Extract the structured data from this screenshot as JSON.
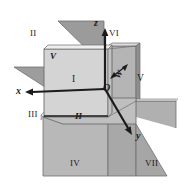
{
  "figure": {
    "background_color": "#ffffff",
    "stroke_color": "#1b1b1b"
  },
  "colors": {
    "plane_light": "#d0d0d0",
    "plane_mid": "#b9b9b9",
    "plane_dark": "#a3a3a3",
    "plane_darker": "#949494",
    "edge": "#6e6e6e",
    "axis": "#1b1b1b",
    "text": "#1b1b1b"
  },
  "axes": [
    {
      "name": "x-axis",
      "label": "x",
      "x": 16,
      "y": 93
    },
    {
      "name": "y-axis",
      "label": "y",
      "x": 136,
      "y": 137
    },
    {
      "name": "z-axis",
      "label": "z",
      "x": 96,
      "y": 24
    }
  ],
  "origin": {
    "name": "origin",
    "label": "O",
    "x": 106,
    "y": 89
  },
  "planes": [
    {
      "name": "v-plane",
      "label": "V",
      "x": 52,
      "y": 57
    },
    {
      "name": "h-plane",
      "label": "H",
      "x": 78,
      "y": 118
    },
    {
      "name": "w-plane",
      "label": "W",
      "x": 119,
      "y": 75
    }
  ],
  "octants": [
    {
      "name": "octant-1",
      "label": "I",
      "x": 75,
      "y": 79
    },
    {
      "name": "octant-2",
      "label": "II",
      "x": 33,
      "y": 33
    },
    {
      "name": "octant-3",
      "label": "III",
      "x": 33,
      "y": 114
    },
    {
      "name": "octant-4",
      "label": "IV",
      "x": 74,
      "y": 163
    },
    {
      "name": "octant-5",
      "label": "V",
      "x": 139,
      "y": 79
    },
    {
      "name": "octant-6",
      "label": "VI",
      "x": 112,
      "y": 33
    },
    {
      "name": "octant-7",
      "label": "VII",
      "x": 149,
      "y": 163
    }
  ]
}
